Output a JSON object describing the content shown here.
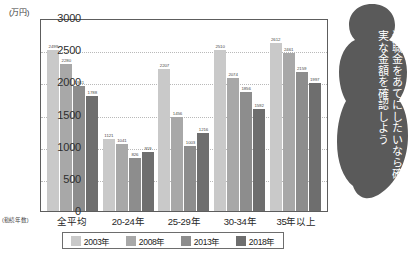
{
  "chart_data": {
    "type": "bar",
    "title": "",
    "unit_label": "(万円)",
    "xlabel_prefix": "(勤続年数)",
    "categories": [
      "全平均",
      "20-24年",
      "25-29年",
      "30-34年",
      "35年以上"
    ],
    "series": [
      {
        "name": "2003年",
        "color": "#c9c9c9",
        "values": [
          2499,
          1121,
          2207,
          2510,
          2612
        ]
      },
      {
        "name": "2008年",
        "color": "#a8a8a8",
        "values": [
          2280,
          1041,
          1456,
          2074,
          2461
        ]
      },
      {
        "name": "2013年",
        "color": "#8d8d8d",
        "values": [
          1941,
          826,
          1003,
          1856,
          2159
        ]
      },
      {
        "name": "2018年",
        "color": "#6e6e6e",
        "values": [
          1788,
          919,
          1216,
          1592,
          1997
        ]
      }
    ],
    "ylim": [
      0,
      3000
    ],
    "yticks": [
      0,
      500,
      1000,
      1500,
      2000,
      2500,
      3000
    ],
    "ylabel": "",
    "grid": true,
    "legend_position": "bottom"
  },
  "annotation": {
    "bubble_text": "退職金をあてにしたいなら確実な金額を確認しよう"
  }
}
